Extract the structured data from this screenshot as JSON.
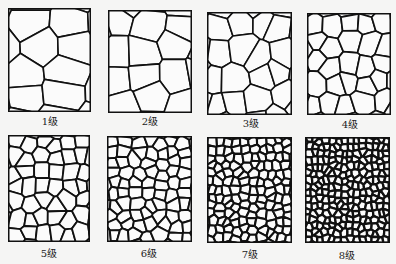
{
  "figure": {
    "panels": [
      {
        "grade": 1,
        "label": "1级",
        "grain_density": "very coarse"
      },
      {
        "grade": 2,
        "label": "2级",
        "grain_density": "coarse"
      },
      {
        "grade": 3,
        "label": "3级",
        "grain_density": "medium-coarse"
      },
      {
        "grade": 4,
        "label": "4级",
        "grain_density": "medium"
      },
      {
        "grade": 5,
        "label": "5级",
        "grain_density": "medium-fine"
      },
      {
        "grade": 6,
        "label": "6级",
        "grain_density": "fine"
      },
      {
        "grade": 7,
        "label": "7级",
        "grain_density": "very fine"
      },
      {
        "grade": 8,
        "label": "8级",
        "grain_density": "ultra fine"
      }
    ],
    "colors": {
      "grain_boundary": "#111111",
      "grain_fill": "#fbfbfb",
      "background": "#f5f5f4"
    }
  }
}
